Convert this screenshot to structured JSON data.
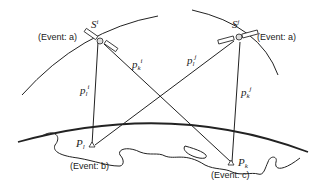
{
  "diagram": {
    "type": "satellite-geometry",
    "satellites": [
      {
        "id": "left",
        "symbol": "S",
        "superscript": "i",
        "event": "(Event: a)"
      },
      {
        "id": "right",
        "symbol": "S",
        "superscript": "j",
        "event": "(Event: a)"
      }
    ],
    "stations": [
      {
        "id": "left",
        "symbol": "P",
        "subscript": "l",
        "event": "(Event: b)"
      },
      {
        "id": "right",
        "symbol": "P",
        "subscript": "k",
        "event": "(Event: c)"
      }
    ],
    "ranges": [
      {
        "label": "p",
        "sub": "l",
        "sup": "i"
      },
      {
        "label": "p",
        "sub": "k",
        "sup": "i"
      },
      {
        "label": "p",
        "sub": "l",
        "sup": "j"
      },
      {
        "label": "p",
        "sub": "k",
        "sup": "j"
      }
    ],
    "colors": {
      "line": "#222222",
      "background": "#ffffff"
    }
  }
}
